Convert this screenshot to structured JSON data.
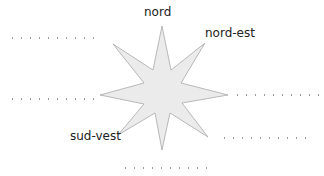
{
  "diagram": {
    "type": "compass-rose",
    "star": {
      "fill": "#ebebeb",
      "stroke": "#a8a8a8",
      "points": 8
    },
    "labels": {
      "north": "nord",
      "northeast": "nord-est",
      "southwest": "sud-vest"
    },
    "blanks": [
      {
        "id": "northwest",
        "filled": false
      },
      {
        "id": "west",
        "filled": false
      },
      {
        "id": "east",
        "filled": false
      },
      {
        "id": "southeast",
        "filled": false
      },
      {
        "id": "south",
        "filled": false
      }
    ]
  }
}
